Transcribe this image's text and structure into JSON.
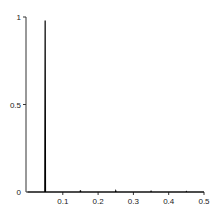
{
  "chart_data": {
    "type": "line",
    "title": "",
    "xlabel": "",
    "ylabel": "",
    "xlim": [
      0,
      0.5
    ],
    "ylim": [
      0,
      1
    ],
    "grid": false,
    "legend": null,
    "x_ticks": [
      0.1,
      0.2,
      0.3,
      0.4,
      0.5
    ],
    "x_tick_labels": [
      "0.1",
      "0.2",
      "0.3",
      "0.4",
      "0.5"
    ],
    "y_ticks": [
      0,
      0.5,
      1
    ],
    "y_tick_labels": [
      "0",
      "0.5",
      "1"
    ],
    "series": [
      {
        "name": "signal",
        "color": "#000000",
        "x": [
          0,
          0.049,
          0.05,
          0.051,
          0.149,
          0.15,
          0.151,
          0.249,
          0.25,
          0.251,
          0.349,
          0.35,
          0.351,
          0.449,
          0.45,
          0.451,
          0.5
        ],
        "y": [
          0,
          0,
          0.98,
          0,
          0,
          0.01,
          0,
          0,
          0.006,
          0,
          0,
          0.004,
          0,
          0,
          0.003,
          0,
          0
        ]
      }
    ]
  },
  "colors": {
    "axis": "#333333",
    "line": "#000000",
    "background": "#ffffff"
  }
}
